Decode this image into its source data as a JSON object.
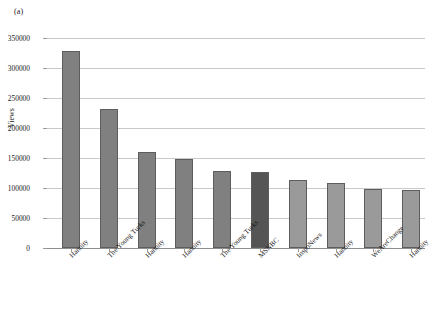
{
  "figure": {
    "panel_label": "(a)"
  },
  "chart_data": {
    "type": "bar",
    "title": "",
    "xlabel": "",
    "ylabel": "Views",
    "ylim": [
      0,
      350000
    ],
    "ytick_labels": [
      "0",
      "50000",
      "100000",
      "150000",
      "200000",
      "250000",
      "300000",
      "350000"
    ],
    "ytick_values": [
      0,
      50000,
      100000,
      150000,
      200000,
      250000,
      300000,
      350000
    ],
    "grid": true,
    "legend": "none",
    "categories": [
      "Hannity",
      "The Young Turks",
      "Hannity",
      "Hannity",
      "The Young Turks",
      "MSNBC",
      "InspoNews",
      "Hannity",
      "WeAreChange",
      "Hannity"
    ],
    "values": [
      328000,
      231000,
      160000,
      149000,
      128000,
      127000,
      113000,
      108000,
      98000,
      97000
    ],
    "bar_colors": [
      "#808080",
      "#808080",
      "#808080",
      "#808080",
      "#808080",
      "#555555",
      "#9a9a9a",
      "#9a9a9a",
      "#9a9a9a",
      "#9a9a9a"
    ]
  }
}
